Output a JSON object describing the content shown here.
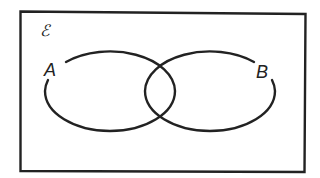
{
  "diagram": {
    "type": "venn",
    "universal_set": {
      "symbol": "ℰ"
    },
    "sets": [
      {
        "id": "A",
        "label": "A"
      },
      {
        "id": "B",
        "label": "B"
      }
    ],
    "colors": {
      "stroke": "#222222",
      "background": "#ffffff"
    }
  }
}
